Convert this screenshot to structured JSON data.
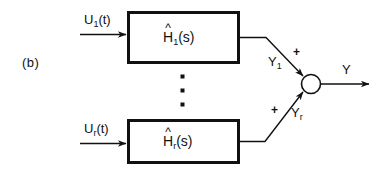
{
  "figure": {
    "panel_label": "(b)",
    "background_color": "#ffffff",
    "line_color": "#111111",
    "text_color": "#111111"
  },
  "inputs": [
    {
      "name": "input-1",
      "base": "U",
      "sub": "1",
      "suffix": "(t)",
      "text": "U1(t)"
    },
    {
      "name": "input-r",
      "base": "U",
      "sub": "r",
      "suffix": "(t)",
      "text": "Ur(t)"
    }
  ],
  "blocks": [
    {
      "name": "block-h1",
      "base": "H",
      "sub": "1",
      "suffix": "(s)",
      "hat": "^",
      "text": "H1(s)"
    },
    {
      "name": "block-hr",
      "base": "H",
      "sub": "r",
      "suffix": "(s)",
      "hat": "^",
      "text": "Hr(s)"
    }
  ],
  "intermediate_signals": [
    {
      "name": "signal-y1",
      "base": "Y",
      "sub": "1",
      "text": "Y1"
    },
    {
      "name": "signal-yr",
      "base": "Y",
      "sub": "r",
      "text": "Yr"
    }
  ],
  "summing_junction": {
    "name": "summing-junction",
    "sign_top": "+",
    "sign_bottom": "+"
  },
  "output": {
    "name": "output-y",
    "label": "Y"
  },
  "ellipsis": {
    "name": "vertical-ellipsis",
    "dots": 3
  }
}
